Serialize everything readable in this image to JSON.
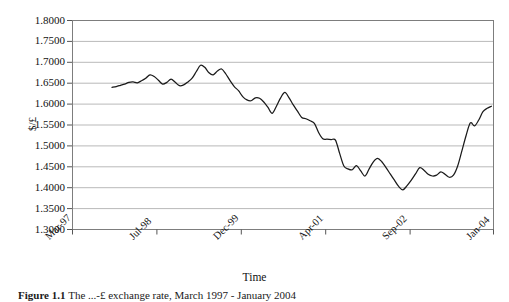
{
  "figure": {
    "caption_label": "Figure 1.1",
    "caption_text": "The ...-£ exchange rate, March 1997 - January 2004"
  },
  "axes": {
    "ylabel": "$/£",
    "xlabel": "Time",
    "yticks": [
      "1.8000",
      "1.7500",
      "1.7000",
      "1.6500",
      "1.6000",
      "1.5500",
      "1.5000",
      "1.4500",
      "1.4000",
      "1.3500",
      "1.3000"
    ],
    "xticks": [
      "Mar-97",
      "Jul-98",
      "Dec-99",
      "Apr-01",
      "Sep-02",
      "Jan-04"
    ]
  },
  "style": {
    "line_color": "#1a1a1a",
    "grid_color": "#b9b9b9",
    "frame_color": "#808080",
    "background": "#ffffff"
  },
  "chart_data": {
    "type": "line",
    "title": "",
    "xlabel": "Time",
    "ylabel": "$/£",
    "xlim": [
      "Mar-97",
      "Jan-04"
    ],
    "ylim": [
      1.3,
      1.8
    ],
    "ytick_step": 0.05,
    "grid": true,
    "legend": "none",
    "categories": [
      "Mar-97",
      "Jul-98",
      "Dec-99",
      "Apr-01",
      "Sep-02",
      "Jan-04"
    ],
    "series": [
      {
        "name": "$/£ exchange rate",
        "x": [
          0.095,
          0.105,
          0.115,
          0.125,
          0.135,
          0.145,
          0.155,
          0.165,
          0.175,
          0.185,
          0.195,
          0.205,
          0.215,
          0.225,
          0.235,
          0.245,
          0.255,
          0.265,
          0.275,
          0.285,
          0.295,
          0.305,
          0.315,
          0.325,
          0.335,
          0.345,
          0.355,
          0.365,
          0.375,
          0.385,
          0.395,
          0.405,
          0.415,
          0.425,
          0.435,
          0.445,
          0.455,
          0.465,
          0.475,
          0.485,
          0.495,
          0.505,
          0.515,
          0.525,
          0.535,
          0.545,
          0.555,
          0.565,
          0.575,
          0.585,
          0.595,
          0.605,
          0.615,
          0.625,
          0.635,
          0.645,
          0.655,
          0.665,
          0.675,
          0.685,
          0.695,
          0.705,
          0.715,
          0.725,
          0.735,
          0.745,
          0.755,
          0.765,
          0.775,
          0.785,
          0.795,
          0.805,
          0.815,
          0.825,
          0.835,
          0.845,
          0.855,
          0.865,
          0.875,
          0.885,
          0.895,
          0.905,
          0.915,
          0.925,
          0.935,
          0.945
        ],
        "values": [
          1.64,
          1.642,
          1.645,
          1.648,
          1.652,
          1.653,
          1.651,
          1.656,
          1.662,
          1.67,
          1.666,
          1.657,
          1.648,
          1.652,
          1.66,
          1.652,
          1.644,
          1.646,
          1.653,
          1.662,
          1.678,
          1.693,
          1.688,
          1.675,
          1.67,
          1.679,
          1.684,
          1.672,
          1.656,
          1.642,
          1.632,
          1.618,
          1.61,
          1.608,
          1.615,
          1.614,
          1.605,
          1.592,
          1.578,
          1.595,
          1.615,
          1.628,
          1.615,
          1.598,
          1.583,
          1.568,
          1.565,
          1.56,
          1.554,
          1.532,
          1.517,
          1.516,
          1.515,
          1.514,
          1.482,
          1.452,
          1.445,
          1.443,
          1.453,
          1.44,
          1.428,
          1.445,
          1.462,
          1.47,
          1.462,
          1.448,
          1.433,
          1.418,
          1.403,
          1.395,
          1.405,
          1.418,
          1.433,
          1.448,
          1.442,
          1.432,
          1.428,
          1.43,
          1.438,
          1.432,
          1.425,
          1.43,
          1.452,
          1.488,
          1.525,
          1.555
        ]
      }
    ],
    "series_continued": {
      "note": "second half of the same single series",
      "x": [
        0.955,
        0.965,
        0.975,
        0.985,
        0.995
      ],
      "values": [
        1.548,
        1.562,
        1.582,
        1.59,
        1.595
      ]
    }
  }
}
